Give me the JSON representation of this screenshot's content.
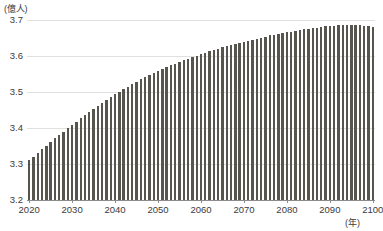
{
  "axes": {
    "y_unit_label": "(億人)",
    "x_unit_label": "(年)",
    "y_ticks": [
      "3.2",
      "3.3",
      "3.4",
      "3.5",
      "3.6",
      "3.7"
    ],
    "x_ticks": [
      "2020",
      "2030",
      "2040",
      "2050",
      "2060",
      "2070",
      "2080",
      "2090",
      "2100"
    ]
  },
  "style": {
    "bar_color": "#56564f",
    "gridline_color": "#e2e0dc",
    "axis_color": "#8c8c8c",
    "text_color": "#3b3b3b",
    "background": "#ffffff"
  },
  "chart_data": {
    "type": "bar",
    "title": "",
    "subtitle": "",
    "xlabel": "(年)",
    "ylabel": "(億人)",
    "ylim": [
      3.2,
      3.7
    ],
    "xlim": [
      2020,
      2100
    ],
    "grid": true,
    "legend": false,
    "series": [
      {
        "name": "人口",
        "values": [
          3.31,
          3.32,
          3.33,
          3.341,
          3.351,
          3.361,
          3.371,
          3.381,
          3.39,
          3.4,
          3.409,
          3.418,
          3.427,
          3.436,
          3.445,
          3.454,
          3.462,
          3.47,
          3.478,
          3.486,
          3.494,
          3.501,
          3.508,
          3.515,
          3.522,
          3.528,
          3.535,
          3.541,
          3.547,
          3.553,
          3.558,
          3.564,
          3.569,
          3.574,
          3.579,
          3.584,
          3.589,
          3.593,
          3.597,
          3.601,
          3.605,
          3.609,
          3.613,
          3.617,
          3.62,
          3.624,
          3.627,
          3.63,
          3.633,
          3.636,
          3.639,
          3.642,
          3.645,
          3.648,
          3.651,
          3.654,
          3.657,
          3.659,
          3.662,
          3.664,
          3.666,
          3.668,
          3.67,
          3.672,
          3.674,
          3.676,
          3.678,
          3.679,
          3.681,
          3.682,
          3.683,
          3.684,
          3.685,
          3.686,
          3.686,
          3.686,
          3.686,
          3.685,
          3.684,
          3.683,
          3.681
        ]
      }
    ],
    "categories": [
      "2020",
      "2021",
      "2022",
      "2023",
      "2024",
      "2025",
      "2026",
      "2027",
      "2028",
      "2029",
      "2030",
      "2031",
      "2032",
      "2033",
      "2034",
      "2035",
      "2036",
      "2037",
      "2038",
      "2039",
      "2040",
      "2041",
      "2042",
      "2043",
      "2044",
      "2045",
      "2046",
      "2047",
      "2048",
      "2049",
      "2050",
      "2051",
      "2052",
      "2053",
      "2054",
      "2055",
      "2056",
      "2057",
      "2058",
      "2059",
      "2060",
      "2061",
      "2062",
      "2063",
      "2064",
      "2065",
      "2066",
      "2067",
      "2068",
      "2069",
      "2070",
      "2071",
      "2072",
      "2073",
      "2074",
      "2075",
      "2076",
      "2077",
      "2078",
      "2079",
      "2080",
      "2081",
      "2082",
      "2083",
      "2084",
      "2085",
      "2086",
      "2087",
      "2088",
      "2089",
      "2090",
      "2091",
      "2092",
      "2093",
      "2094",
      "2095",
      "2096",
      "2097",
      "2098",
      "2099",
      "2100"
    ]
  }
}
